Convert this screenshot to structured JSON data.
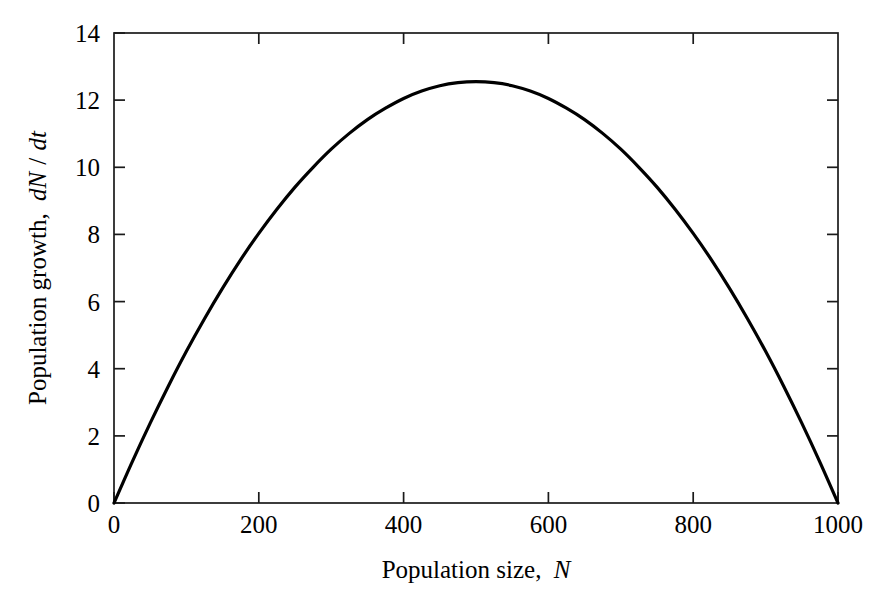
{
  "chart_data": {
    "type": "line",
    "title": "",
    "xlabel": "Population size, N",
    "xlabel_parts": {
      "text": "Population size,",
      "symbol": "N"
    },
    "ylabel": "Population growth, dN/dt",
    "ylabel_parts": {
      "text": "Population growth,",
      "symbol_num": "dN",
      "slash": "/",
      "symbol_den": "dt"
    },
    "xlim": [
      0,
      1000
    ],
    "ylim": [
      0,
      14
    ],
    "xticks": [
      0,
      200,
      400,
      600,
      800,
      1000
    ],
    "yticks": [
      0,
      2,
      4,
      6,
      8,
      10,
      12,
      14
    ],
    "xticklabels": [
      "0",
      "200",
      "400",
      "600",
      "800",
      "1000"
    ],
    "yticklabels": [
      "0",
      "2",
      "4",
      "6",
      "8",
      "10",
      "12",
      "14"
    ],
    "grid": false,
    "legend": "none",
    "frame": "box",
    "tick_direction": "in",
    "line_color": "#000000",
    "axis_color": "#1a1a1a",
    "background_color": "#ffffff",
    "model": "logistic growth dN/dt = rN(1 - N/K)",
    "carrying_capacity_K": 1000,
    "intrinsic_rate_r": 0.0502,
    "peak_x": 500,
    "peak_y": 12.55,
    "x": [
      0,
      25,
      50,
      75,
      100,
      125,
      150,
      175,
      200,
      225,
      250,
      275,
      300,
      325,
      350,
      375,
      400,
      425,
      450,
      475,
      500,
      525,
      550,
      575,
      600,
      625,
      650,
      675,
      700,
      725,
      750,
      775,
      800,
      825,
      850,
      875,
      900,
      925,
      950,
      975,
      1000
    ],
    "values": [
      0.0,
      1.22,
      2.38,
      3.48,
      4.52,
      5.49,
      6.4,
      7.25,
      8.03,
      8.75,
      9.41,
      10.0,
      10.54,
      11.01,
      11.42,
      11.76,
      12.05,
      12.27,
      12.43,
      12.52,
      12.55,
      12.52,
      12.43,
      12.27,
      12.05,
      11.76,
      11.42,
      11.01,
      10.54,
      10.0,
      9.41,
      8.75,
      8.03,
      7.25,
      6.4,
      5.49,
      4.52,
      3.48,
      2.38,
      1.22,
      0.0
    ]
  },
  "labels": {
    "xtick_0": "0",
    "xtick_1": "200",
    "xtick_2": "400",
    "xtick_3": "600",
    "xtick_4": "800",
    "xtick_5": "1000",
    "ytick_0": "0",
    "ytick_1": "2",
    "ytick_2": "4",
    "ytick_3": "6",
    "ytick_4": "8",
    "ytick_5": "10",
    "ytick_6": "12",
    "ytick_7": "14",
    "xaxis_title_text": "Population size,",
    "xaxis_title_symbol": "N",
    "yaxis_title_text": "Population growth,",
    "yaxis_title_num": "dN",
    "yaxis_title_slash": "/",
    "yaxis_title_den": "dt"
  }
}
